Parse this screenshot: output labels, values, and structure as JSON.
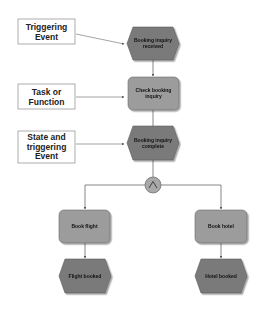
{
  "diagram": {
    "type": "EPC (Event-driven Process Chain)",
    "colors": {
      "event_fill": "#7a7a7a",
      "function_fill": "#9c9c9c",
      "connector_fill": "#a8a8a8",
      "line": "#555555",
      "legend_border": "#888888"
    },
    "legend": [
      {
        "id": "triggering-event",
        "lines": [
          "Triggering",
          "Event"
        ]
      },
      {
        "id": "task-or-function",
        "lines": [
          "Task or",
          "Function"
        ]
      },
      {
        "id": "state-triggering-event",
        "lines": [
          "State and",
          "triggering",
          "Event"
        ]
      }
    ],
    "nodes": {
      "event_received": {
        "kind": "event",
        "lines": [
          "Booking inquiry",
          "received"
        ]
      },
      "check_inquiry": {
        "kind": "function",
        "lines": [
          "Check booking",
          "inquiry"
        ]
      },
      "event_complete": {
        "kind": "event",
        "lines": [
          "Booking inquiry",
          "complete"
        ]
      },
      "connector": {
        "kind": "connector",
        "symbol": "∧",
        "label": "AND"
      },
      "book_flight": {
        "kind": "function",
        "lines": [
          "Book flight"
        ]
      },
      "flight_booked": {
        "kind": "event",
        "lines": [
          "Flight booked"
        ]
      },
      "book_hotel": {
        "kind": "function",
        "lines": [
          "Book hotel"
        ]
      },
      "hotel_booked": {
        "kind": "event",
        "lines": [
          "Hotel booked"
        ]
      }
    }
  }
}
